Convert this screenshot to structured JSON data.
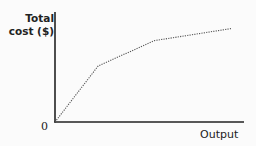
{
  "chart_data": {
    "type": "line",
    "title": "",
    "xlabel": "Output",
    "ylabel": "Total cost ($)",
    "origin_label": "0",
    "grid": false,
    "line_style": "dotted",
    "x": [
      0,
      0.23,
      0.53,
      0.94
    ],
    "series": [
      {
        "name": "Total cost",
        "values": [
          0,
          0.51,
          0.74,
          0.85
        ]
      }
    ],
    "xlim": [
      0,
      1
    ],
    "ylim": [
      0,
      1
    ],
    "colors": {
      "axis": "#222222",
      "line": "#555555",
      "background": "#fbfbfb"
    }
  }
}
